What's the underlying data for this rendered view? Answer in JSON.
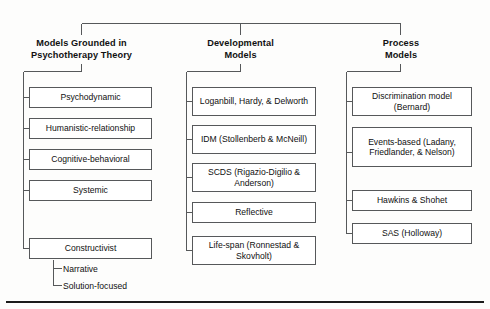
{
  "diagram": {
    "type": "hierarchy-tree",
    "line_color": "#56585a",
    "rule_color": "#1b1b1b",
    "columns": [
      {
        "id": "psychotherapy-theory",
        "header_line1": "Models Grounded in",
        "header_line2": "Psychotherapy Theory",
        "nodes": [
          {
            "id": "psychodynamic",
            "text": "Psychodynamic"
          },
          {
            "id": "humanistic-relationship",
            "text": "Humanistic-relationship"
          },
          {
            "id": "cognitive-behavioral",
            "text": "Cognitive-behavioral"
          },
          {
            "id": "systemic",
            "text": "Systemic"
          },
          {
            "id": "constructivist",
            "text": "Constructivist"
          }
        ],
        "subnodes": [
          {
            "id": "narrative",
            "text": "Narrative"
          },
          {
            "id": "solution-focused",
            "text": "Solution-focused"
          }
        ]
      },
      {
        "id": "developmental-models",
        "header_line1": "Developmental",
        "header_line2": "Models",
        "nodes": [
          {
            "id": "loganbill-hardy-delworth",
            "text": "Loganbill, Hardy, & Delworth"
          },
          {
            "id": "idm-stollenberb-mcneill",
            "text": "IDM (Stollenberb & McNeill)"
          },
          {
            "id": "scds-rigazio-digilio-anderson",
            "text": "SCDS (Rigazio-Digilio & Anderson)"
          },
          {
            "id": "reflective",
            "text": "Reflective"
          },
          {
            "id": "life-span-ronnestad-skovholt",
            "text": "Life-span (Ronnestad & Skovholt)"
          }
        ],
        "subnodes": []
      },
      {
        "id": "process-models",
        "header_line1": "Process",
        "header_line2": "Models",
        "nodes": [
          {
            "id": "discrimination-model-bernard",
            "text": "Discrimination model (Bernard)"
          },
          {
            "id": "events-based-ladany-friedlander-nelson",
            "text": "Events-based (Ladany, Friedlander, & Nelson)"
          },
          {
            "id": "hawkins-shohet",
            "text": "Hawkins & Shohet"
          },
          {
            "id": "sas-holloway",
            "text": "SAS (Holloway)"
          }
        ],
        "subnodes": []
      }
    ]
  }
}
